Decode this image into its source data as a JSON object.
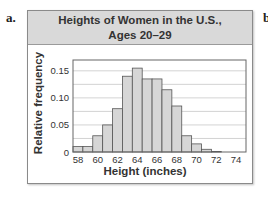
{
  "part_label": "a.",
  "next_part_label": "b",
  "chart_data": {
    "type": "bar",
    "title": "Heights of Women in the U.S.,",
    "subtitle": "Ages 20–29",
    "xlabel": "Height (inches)",
    "ylabel": "Relative frequency",
    "categories": [
      58,
      59,
      60,
      61,
      62,
      63,
      64,
      65,
      66,
      67,
      68,
      69,
      70,
      71,
      72
    ],
    "values": [
      0.01,
      0.01,
      0.03,
      0.05,
      0.08,
      0.14,
      0.155,
      0.135,
      0.135,
      0.115,
      0.085,
      0.03,
      0.015,
      0.005,
      0.001
    ],
    "x_tick_labels": [
      "58",
      "60",
      "62",
      "64",
      "66",
      "68",
      "70",
      "72",
      "74"
    ],
    "x_ticks": [
      58,
      60,
      62,
      64,
      66,
      68,
      70,
      72,
      74
    ],
    "y_tick_labels": [
      "0",
      "0.05",
      "0.10",
      "0.15"
    ],
    "y_ticks": [
      0,
      0.05,
      0.1,
      0.15
    ],
    "xlim": [
      57.5,
      75
    ],
    "ylim": [
      0,
      0.17
    ],
    "grid": true,
    "bar_color": "#d6d6d6",
    "bar_edge_color": "#555555"
  }
}
